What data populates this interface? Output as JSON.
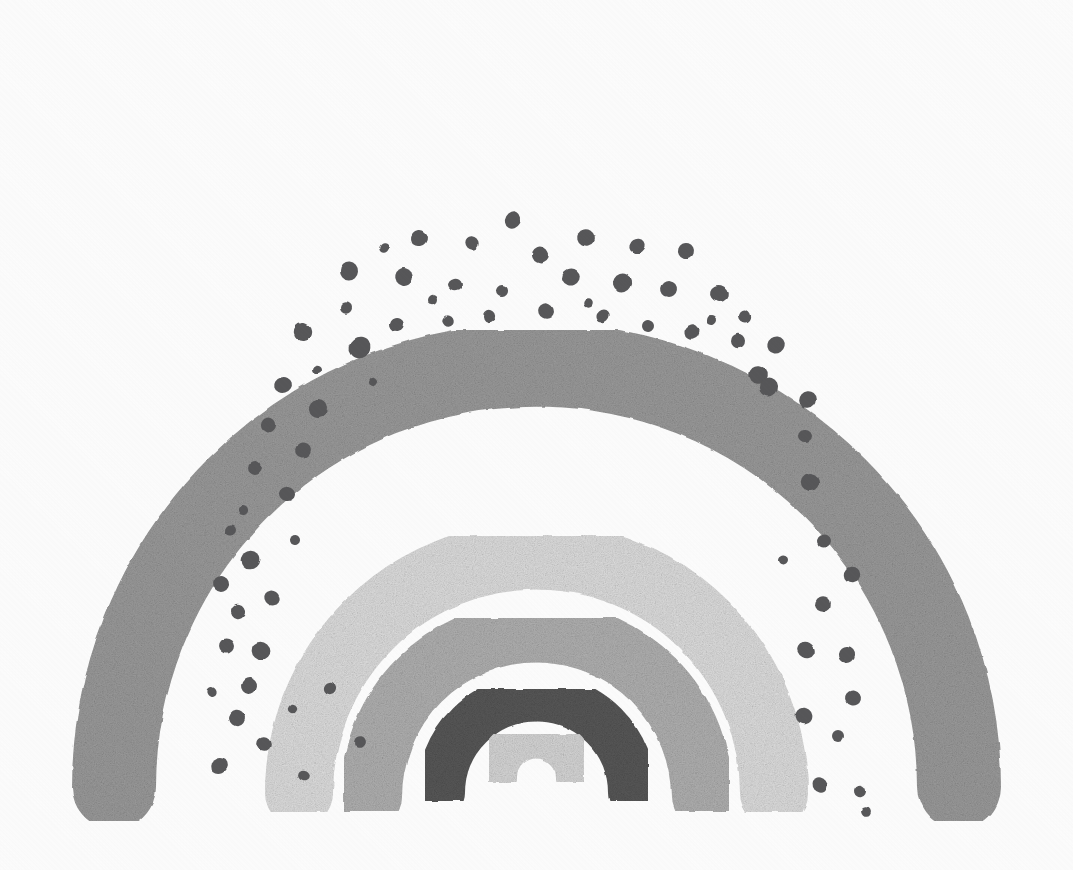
{
  "artwork": {
    "title": "Boho Rainbow",
    "subject": "nested-arch-rainbow-with-dots",
    "style": "grayscale gouache / hand-painted boho nursery rainbow",
    "background_color": "#ffffff",
    "canvas": {
      "width": 1073,
      "height": 870
    },
    "band_count": 6,
    "dot_count": 76
  },
  "palette": {
    "background": "#ffffff",
    "band_outer_gray": "#9c9c9c",
    "band_dotted_white": "#ffffff",
    "band_pale_gray": "#e0e0e0",
    "band_mid_gray": "#b2b2b2",
    "band_charcoal": "#585858",
    "band_inner_pale": "#d8d8d8",
    "dot_color": "#58585a"
  },
  "chart_data": {
    "type": "scatter",
    "xlabel": "",
    "ylabel": "",
    "xlim": [
      0,
      1073
    ],
    "ylim": [
      0,
      870
    ],
    "grid": false,
    "legend": "none",
    "center": {
      "cx": 536.5,
      "cy": 793
    },
    "series": [
      {
        "name": "band-1-outer-gray",
        "color": "#9c9c9c",
        "radius": 405,
        "thickness": 84,
        "leg_bottom_y": 787,
        "leg_left_x": 114,
        "leg_right_x": 959,
        "top_outer_y": 62,
        "top_inner_y": 146
      },
      {
        "name": "band-2-dotted-white",
        "color": "#ffffff",
        "radius": 318,
        "thickness": 90,
        "leg_bottom_y": 800,
        "leg_left_x": 219,
        "leg_right_x": 854,
        "top_outer_y": 150,
        "top_inner_y": 240,
        "contains_dots": true
      },
      {
        "name": "band-3-pale-gray",
        "color": "#e0e0e0",
        "radius": 238,
        "thickness": 68,
        "leg_bottom_y": 793,
        "leg_left_x": 299,
        "leg_right_x": 774,
        "top_outer_y": 310,
        "top_inner_y": 378
      },
      {
        "name": "band-4-mid-gray",
        "color": "#b2b2b2",
        "radius": 165,
        "thickness": 62,
        "leg_bottom_y": 797,
        "leg_left_x": 371,
        "leg_right_x": 702,
        "top_outer_y": 404,
        "top_inner_y": 466
      },
      {
        "name": "band-5-charcoal",
        "color": "#585858",
        "radius": 96,
        "thickness": 48,
        "leg_bottom_y": 793,
        "leg_left_x": 441,
        "leg_right_x": 632,
        "top_outer_y": 505,
        "top_inner_y": 553
      },
      {
        "name": "band-6-inner-pale",
        "color": "#d8d8d8",
        "radius": 40,
        "thickness": 42,
        "leg_bottom_y": 778,
        "leg_left_x": 496,
        "leg_right_x": 577,
        "top_outer_y": 592,
        "top_inner_y": 634
      }
    ],
    "dots": {
      "color": "#58585a",
      "radius_range": [
        4,
        10
      ],
      "arcs": [
        {
          "arc_radius": 357,
          "count": 16
        },
        {
          "arc_radius": 318,
          "count": 16
        },
        {
          "arc_radius": 281,
          "count": 15
        },
        {
          "arc_radius": 245,
          "count": 14
        }
      ],
      "points": [
        {
          "x": 513,
          "y": 220,
          "r": 9
        },
        {
          "x": 419,
          "y": 238,
          "r": 8
        },
        {
          "x": 472,
          "y": 243,
          "r": 7
        },
        {
          "x": 540,
          "y": 255,
          "r": 8
        },
        {
          "x": 586,
          "y": 238,
          "r": 9
        },
        {
          "x": 637,
          "y": 246,
          "r": 8
        },
        {
          "x": 686,
          "y": 251,
          "r": 8
        },
        {
          "x": 384,
          "y": 248,
          "r": 5
        },
        {
          "x": 349,
          "y": 271,
          "r": 9
        },
        {
          "x": 404,
          "y": 277,
          "r": 9
        },
        {
          "x": 455,
          "y": 285,
          "r": 7
        },
        {
          "x": 502,
          "y": 291,
          "r": 6
        },
        {
          "x": 571,
          "y": 277,
          "r": 9
        },
        {
          "x": 622,
          "y": 283,
          "r": 9
        },
        {
          "x": 669,
          "y": 289,
          "r": 8
        },
        {
          "x": 719,
          "y": 294,
          "r": 9
        },
        {
          "x": 303,
          "y": 332,
          "r": 9
        },
        {
          "x": 346,
          "y": 308,
          "r": 6
        },
        {
          "x": 360,
          "y": 348,
          "r": 10
        },
        {
          "x": 397,
          "y": 324,
          "r": 7
        },
        {
          "x": 448,
          "y": 321,
          "r": 6
        },
        {
          "x": 489,
          "y": 316,
          "r": 6
        },
        {
          "x": 546,
          "y": 311,
          "r": 8
        },
        {
          "x": 603,
          "y": 316,
          "r": 7
        },
        {
          "x": 648,
          "y": 326,
          "r": 6
        },
        {
          "x": 692,
          "y": 332,
          "r": 8
        },
        {
          "x": 738,
          "y": 341,
          "r": 7
        },
        {
          "x": 758,
          "y": 375,
          "r": 9
        },
        {
          "x": 283,
          "y": 385,
          "r": 9
        },
        {
          "x": 318,
          "y": 409,
          "r": 9
        },
        {
          "x": 303,
          "y": 450,
          "r": 8
        },
        {
          "x": 268,
          "y": 425,
          "r": 7
        },
        {
          "x": 255,
          "y": 468,
          "r": 7
        },
        {
          "x": 287,
          "y": 494,
          "r": 8
        },
        {
          "x": 243,
          "y": 510,
          "r": 5
        },
        {
          "x": 231,
          "y": 531,
          "r": 6
        },
        {
          "x": 250,
          "y": 560,
          "r": 9
        },
        {
          "x": 221,
          "y": 584,
          "r": 8
        },
        {
          "x": 272,
          "y": 598,
          "r": 8
        },
        {
          "x": 238,
          "y": 612,
          "r": 7
        },
        {
          "x": 227,
          "y": 646,
          "r": 8
        },
        {
          "x": 261,
          "y": 651,
          "r": 9
        },
        {
          "x": 249,
          "y": 686,
          "r": 8
        },
        {
          "x": 212,
          "y": 692,
          "r": 5
        },
        {
          "x": 237,
          "y": 718,
          "r": 8
        },
        {
          "x": 264,
          "y": 744,
          "r": 7
        },
        {
          "x": 219,
          "y": 766,
          "r": 9
        },
        {
          "x": 292,
          "y": 709,
          "r": 4
        },
        {
          "x": 776,
          "y": 345,
          "r": 9
        },
        {
          "x": 769,
          "y": 387,
          "r": 9
        },
        {
          "x": 808,
          "y": 400,
          "r": 9
        },
        {
          "x": 805,
          "y": 436,
          "r": 7
        },
        {
          "x": 810,
          "y": 482,
          "r": 9
        },
        {
          "x": 824,
          "y": 541,
          "r": 7
        },
        {
          "x": 852,
          "y": 575,
          "r": 8
        },
        {
          "x": 823,
          "y": 604,
          "r": 8
        },
        {
          "x": 806,
          "y": 650,
          "r": 9
        },
        {
          "x": 847,
          "y": 655,
          "r": 8
        },
        {
          "x": 853,
          "y": 698,
          "r": 8
        },
        {
          "x": 804,
          "y": 716,
          "r": 8
        },
        {
          "x": 838,
          "y": 736,
          "r": 6
        },
        {
          "x": 820,
          "y": 785,
          "r": 8
        },
        {
          "x": 860,
          "y": 791,
          "r": 6
        },
        {
          "x": 866,
          "y": 812,
          "r": 5
        },
        {
          "x": 744,
          "y": 316,
          "r": 6
        },
        {
          "x": 712,
          "y": 320,
          "r": 5
        },
        {
          "x": 588,
          "y": 303,
          "r": 5
        },
        {
          "x": 432,
          "y": 300,
          "r": 5
        },
        {
          "x": 373,
          "y": 382,
          "r": 4
        },
        {
          "x": 317,
          "y": 369,
          "r": 5
        },
        {
          "x": 295,
          "y": 540,
          "r": 5
        },
        {
          "x": 783,
          "y": 560,
          "r": 5
        },
        {
          "x": 330,
          "y": 688,
          "r": 6
        },
        {
          "x": 360,
          "y": 742,
          "r": 6
        },
        {
          "x": 304,
          "y": 775,
          "r": 6
        }
      ]
    }
  }
}
